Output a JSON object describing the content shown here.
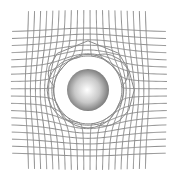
{
  "diagram": {
    "background": "#ffffff",
    "line_color": "#8a8a8a",
    "sphere": {
      "cx": 88,
      "cy": 90,
      "r": 21,
      "highlight_color": "#ffffff",
      "mid_color": "#c8c8c8",
      "edge_color": "#6e6e6e"
    },
    "vertical_lines": {
      "count": 20,
      "x_start": 29,
      "spacing": 6.1,
      "y_top": 12,
      "y_bottom": 168
    },
    "horizontal_lines": {
      "count": 18,
      "y_start": 32,
      "spacing": 7.1,
      "x_left": 13,
      "x_right": 165
    },
    "distortion_strength": 0.5
  }
}
